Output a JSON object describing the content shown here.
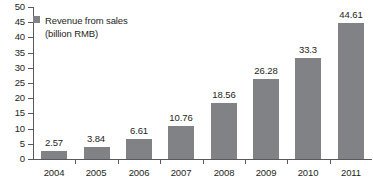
{
  "chart_data": {
    "type": "bar",
    "title": "",
    "xlabel": "",
    "ylabel": "",
    "categories": [
      "2004",
      "2005",
      "2006",
      "2007",
      "2008",
      "2009",
      "2010",
      "2011"
    ],
    "values": [
      2.57,
      3.84,
      6.61,
      10.76,
      18.56,
      26.28,
      33.3,
      44.61
    ],
    "value_labels": [
      "2.57",
      "3.84",
      "6.61",
      "10.76",
      "18.56",
      "26.28",
      "33.3",
      "44.61"
    ],
    "series": [
      {
        "name": "Revenue from sales (billion RMB)",
        "values": [
          2.57,
          3.84,
          6.61,
          10.76,
          18.56,
          26.28,
          33.3,
          44.61
        ],
        "color": "#808285"
      }
    ],
    "ylim": [
      0,
      50
    ],
    "yticks": [
      0,
      5,
      10,
      15,
      20,
      25,
      30,
      35,
      40,
      45,
      50
    ],
    "ytick_labels": [
      "0",
      "5",
      "10",
      "15",
      "20",
      "25",
      "30",
      "35",
      "40",
      "45",
      "50"
    ],
    "grid": false,
    "legend_position": "top-left",
    "legend": {
      "swatch_color": "#808285",
      "line1": "Revenue from sales",
      "line2": "(billion RMB)"
    },
    "axis_color": "#58595b",
    "text_color": "#231f20",
    "background": "#ffffff"
  }
}
